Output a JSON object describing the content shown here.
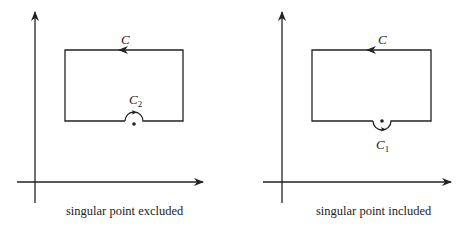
{
  "panels": [
    {
      "id": "left",
      "caption": "singular point excluded",
      "contour_label": "C",
      "indent_label": "C",
      "indent_subscript": "2",
      "indent_direction": "above (point excluded)"
    },
    {
      "id": "right",
      "caption": "singular point included",
      "contour_label": "C",
      "indent_label": "C",
      "indent_subscript": "1",
      "indent_direction": "below (point included)"
    }
  ],
  "colors": {
    "stroke": "#222222",
    "background": "#ffffff"
  }
}
